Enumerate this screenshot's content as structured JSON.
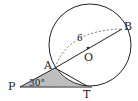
{
  "diagram": {
    "type": "circle-tangent-geometry",
    "points": {
      "A": {
        "label": "A"
      },
      "B": {
        "label": "B"
      },
      "O": {
        "label": "O"
      },
      "P": {
        "label": "P"
      },
      "T": {
        "label": "T"
      }
    },
    "measurements": {
      "AB_length": "6",
      "angle_P": "30°"
    },
    "colors": {
      "stroke": "#222222",
      "shade": "#bfbfbf",
      "dashed": "#555555"
    }
  }
}
